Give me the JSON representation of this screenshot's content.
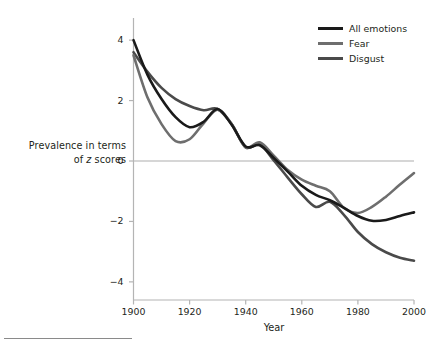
{
  "chart_data": {
    "type": "line",
    "title": "",
    "xlabel": "Year",
    "ylabel_line1": "Prevalence in terms",
    "ylabel_line2_prefix": "of ",
    "ylabel_line2_italic": "z",
    "ylabel_line2_suffix": " scores",
    "ylabel_plain": "Prevalence in terms of z scores",
    "xlim": [
      1900,
      2000
    ],
    "ylim": [
      -4.6,
      4.6
    ],
    "xticks": [
      1900,
      1920,
      1940,
      1960,
      1980,
      2000
    ],
    "xtick_labels": [
      "1900",
      "1920",
      "1940",
      "1960",
      "1980",
      "2000"
    ],
    "yticks": [
      4,
      2,
      0,
      -2,
      -4
    ],
    "ytick_labels": [
      "4",
      "2",
      "0",
      "−2",
      "−4"
    ],
    "grid": false,
    "zero_line": true,
    "zero_line_color": "#c9c9c9",
    "axis_color": "#b4b4b4",
    "legend_position": "top-right",
    "x": [
      1900,
      1905,
      1910,
      1915,
      1920,
      1925,
      1930,
      1935,
      1940,
      1945,
      1950,
      1955,
      1960,
      1965,
      1970,
      1975,
      1980,
      1985,
      1990,
      1995,
      2000
    ],
    "series": [
      {
        "name": "All emotions",
        "color": "#1a1a1a",
        "width": 2.6,
        "values": [
          4.0,
          2.85,
          2.05,
          1.45,
          1.12,
          1.3,
          1.72,
          1.2,
          0.48,
          0.52,
          0.1,
          -0.35,
          -0.82,
          -1.12,
          -1.3,
          -1.55,
          -1.82,
          -1.98,
          -1.95,
          -1.82,
          -1.7
        ]
      },
      {
        "name": "Fear",
        "color": "#6e6e6e",
        "width": 2.6,
        "values": [
          3.5,
          2.1,
          1.22,
          0.66,
          0.72,
          1.25,
          1.7,
          1.22,
          0.45,
          0.62,
          0.18,
          -0.3,
          -0.62,
          -0.82,
          -1.0,
          -1.55,
          -1.72,
          -1.52,
          -1.18,
          -0.78,
          -0.4
        ]
      },
      {
        "name": "Disgust",
        "color": "#4a4a4a",
        "width": 2.6,
        "values": [
          3.6,
          2.95,
          2.42,
          2.05,
          1.82,
          1.68,
          1.72,
          1.22,
          0.45,
          0.55,
          0.02,
          -0.55,
          -1.1,
          -1.52,
          -1.35,
          -1.78,
          -2.35,
          -2.75,
          -3.02,
          -3.2,
          -3.3
        ]
      }
    ],
    "legend": [
      {
        "label": "All emotions",
        "color": "#1a1a1a"
      },
      {
        "label": "Fear",
        "color": "#6e6e6e"
      },
      {
        "label": "Disgust",
        "color": "#4a4a4a"
      }
    ]
  }
}
